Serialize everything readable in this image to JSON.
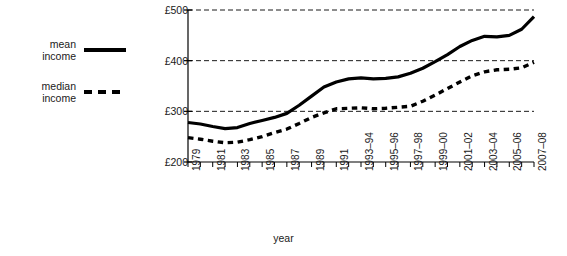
{
  "chart_data": {
    "type": "line",
    "title": "",
    "xlabel": "year",
    "ylabel": "real income (2007–08 prices)",
    "ylim": [
      200,
      500
    ],
    "yticks": [
      200,
      300,
      400,
      500
    ],
    "ytick_labels": [
      "£200",
      "£300",
      "£400",
      "£500"
    ],
    "grid": "horizontal dashed gridlines at £300, £400, £500",
    "legend_position": "left outside",
    "categories": [
      "1979",
      "1980",
      "1981",
      "1982",
      "1983",
      "1984",
      "1985",
      "1986",
      "1987",
      "1988",
      "1989",
      "1990",
      "1991",
      "1992",
      "1993–94",
      "1994–95",
      "1995–96",
      "1996–97",
      "1997–98",
      "1998–99",
      "1999–00",
      "2000–01",
      "2001–02",
      "2002–03",
      "2003–04",
      "2004–05",
      "2005–06",
      "2006–07",
      "2007–08"
    ],
    "tick_labels_shown": [
      "1979",
      "1981",
      "1983",
      "1985",
      "1987",
      "1989",
      "1991",
      "1993–94",
      "1995–96",
      "1997–98",
      "1999–00",
      "2001–02",
      "2003–04",
      "2005–06",
      "2007–08"
    ],
    "series": [
      {
        "name": "mean income",
        "style": "solid",
        "values": [
          278,
          275,
          270,
          266,
          268,
          276,
          282,
          288,
          296,
          312,
          330,
          348,
          358,
          364,
          366,
          364,
          365,
          368,
          375,
          385,
          398,
          412,
          428,
          440,
          448,
          447,
          450,
          462,
          487
        ]
      },
      {
        "name": "median income",
        "style": "dashed",
        "values": [
          248,
          245,
          241,
          238,
          239,
          244,
          250,
          258,
          265,
          276,
          288,
          297,
          305,
          306,
          307,
          305,
          306,
          308,
          310,
          320,
          332,
          345,
          358,
          370,
          378,
          382,
          383,
          386,
          397
        ]
      }
    ]
  },
  "legend": {
    "items": [
      {
        "label": "mean\nincome",
        "style": "solid"
      },
      {
        "label": "median\nincome",
        "style": "dashed"
      }
    ]
  }
}
